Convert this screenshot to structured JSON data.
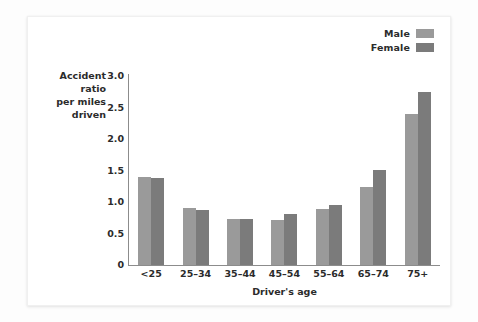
{
  "chart_data": {
    "type": "bar",
    "title": "",
    "xlabel": "Driver's age",
    "ylabel": "Accident ratio per miles driven",
    "ylabel_lines": [
      "Accident ratio",
      "per miles",
      "driven"
    ],
    "categories": [
      "<25",
      "25–34",
      "35–44",
      "45–54",
      "55–64",
      "65–74",
      "75+"
    ],
    "series": [
      {
        "name": "Male",
        "color": "#9a9a9a",
        "values": [
          1.39,
          0.9,
          0.73,
          0.71,
          0.89,
          1.24,
          2.39
        ]
      },
      {
        "name": "Female",
        "color": "#7b7b7b",
        "values": [
          1.38,
          0.87,
          0.73,
          0.81,
          0.96,
          1.51,
          2.75
        ]
      }
    ],
    "ylim": [
      0,
      3.0
    ],
    "yticks": [
      "3.0",
      "2.5",
      "2.0",
      "1.5",
      "1.0",
      "0.5",
      "0"
    ],
    "ytick_values": [
      3.0,
      2.5,
      2.0,
      1.5,
      1.0,
      0.5,
      0
    ],
    "grid": false,
    "legend_position": "top-right"
  },
  "legend": {
    "entries": [
      {
        "label": "Male",
        "color": "#9a9a9a"
      },
      {
        "label": "Female",
        "color": "#7b7b7b"
      }
    ]
  },
  "colors": {
    "male": "#9a9a9a",
    "female": "#7b7b7b",
    "axis": "#8c8c8c",
    "text": "#2b2b2b",
    "card_background": "#ffffff",
    "page_background": "#fdfdfd"
  }
}
